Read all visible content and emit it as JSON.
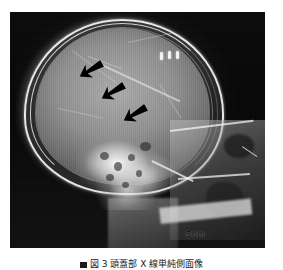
{
  "figure": {
    "caption_marker": "■",
    "caption_text": "図 3  頭蓋部 X 線単純側面像",
    "modality_label": "lateral skull radiograph"
  },
  "radiograph": {
    "scale_label": "5cm",
    "background_color": "#050505",
    "bone_color": "#f8f8f8",
    "soft_tissue_color": "#9c9c9c"
  },
  "annotations": {
    "arrow_color": "#000000",
    "arrows": [
      {
        "id": "arrow-1",
        "label": "arrow-upper-left",
        "x": 78,
        "y": 60,
        "rotation": -28
      },
      {
        "id": "arrow-2",
        "label": "arrow-middle",
        "x": 100,
        "y": 82,
        "rotation": -28
      },
      {
        "id": "arrow-3",
        "label": "arrow-lower-right",
        "x": 122,
        "y": 104,
        "rotation": -28
      }
    ],
    "markers": [
      {
        "id": "marker-1",
        "label": "metallic-clip-1",
        "x": 160,
        "y": 52
      },
      {
        "id": "marker-2",
        "label": "metallic-clip-2",
        "x": 168,
        "y": 51
      },
      {
        "id": "marker-3",
        "label": "metallic-clip-3",
        "x": 176,
        "y": 51
      }
    ]
  }
}
